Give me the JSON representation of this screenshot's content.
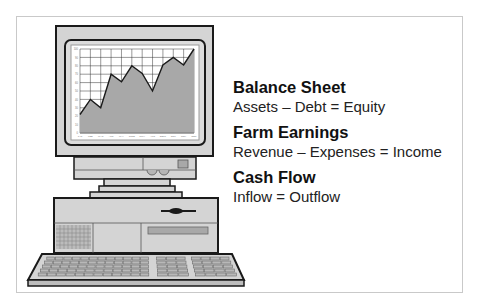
{
  "sections": [
    {
      "title": "Balance Sheet",
      "formula": "Assets – Debt = Equity"
    },
    {
      "title": "Farm Earnings",
      "formula": "Revenue – Expenses = Income"
    },
    {
      "title": "Cash Flow",
      "formula": "Inflow = Outflow"
    }
  ],
  "colors": {
    "outline": "#1a1a1a",
    "body_gray": "#d4d4d4",
    "chart_fill": "#a8a8a8",
    "frame_border": "#c9c9c9"
  },
  "chart_data": {
    "type": "area",
    "title": "",
    "categories": [
      "JAN",
      "FEB",
      "MAR",
      "APR",
      "MAY",
      "JUNE",
      "JULY",
      "AUG",
      "SEPT",
      "OCT",
      "NOV",
      "DEC"
    ],
    "values": [
      22,
      40,
      30,
      70,
      61,
      80,
      71,
      50,
      81,
      90,
      81,
      100
    ],
    "yticks": [
      0,
      10,
      20,
      30,
      40,
      50,
      60,
      70,
      80,
      90,
      100
    ],
    "xlabel": "",
    "ylabel": "",
    "ylim": [
      0,
      100
    ],
    "grid": true,
    "legend": null
  }
}
